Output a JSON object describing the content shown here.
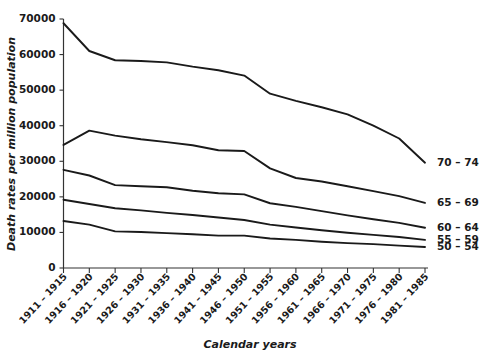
{
  "chart_data": {
    "type": "line",
    "title": "",
    "xlabel": "Calendar years",
    "ylabel": "Death rates per million population",
    "xlim": [
      0,
      14
    ],
    "ylim": [
      0,
      70000
    ],
    "yticks": [
      0,
      10000,
      20000,
      30000,
      40000,
      50000,
      60000,
      70000
    ],
    "ytick_labels": [
      "0",
      "10000",
      "20000",
      "30000",
      "40000",
      "50000",
      "60000",
      "70000"
    ],
    "grid": false,
    "legend_position": "right-inline-end-of-line",
    "categories": [
      "1911 – 1915",
      "1916 – 1920",
      "1921 – 1925",
      "1926 – 1930",
      "1931 – 1935",
      "1936 – 1940",
      "1941 – 1945",
      "1946 – 1950",
      "1951 – 1955",
      "1956 – 1960",
      "1961 – 1965",
      "1966 – 1970",
      "1971 – 1975",
      "1976 – 1980",
      "1981 – 1985"
    ],
    "series": [
      {
        "name": "70 – 74",
        "values": [
          68800,
          61000,
          58400,
          58200,
          57800,
          56600,
          55600,
          54100,
          49000,
          47000,
          45200,
          43200,
          40000,
          36400,
          29600
        ]
      },
      {
        "name": "65 – 69",
        "values": [
          34600,
          38600,
          37200,
          36200,
          35400,
          34500,
          33100,
          32900,
          28000,
          25300,
          24300,
          23000,
          21600,
          20200,
          18300
        ]
      },
      {
        "name": "60 – 64",
        "values": [
          27600,
          26000,
          23300,
          23000,
          22700,
          21700,
          21000,
          20700,
          18200,
          17200,
          16000,
          14800,
          13700,
          12700,
          11300
        ]
      },
      {
        "name": "55 – 59",
        "values": [
          19200,
          18000,
          16800,
          16200,
          15500,
          14900,
          14200,
          13500,
          12200,
          11400,
          10600,
          9900,
          9300,
          8700,
          7900
        ]
      },
      {
        "name": "50 – 54",
        "values": [
          13200,
          12200,
          10300,
          10100,
          9800,
          9500,
          9100,
          9100,
          8300,
          7900,
          7400,
          7000,
          6700,
          6300,
          5900
        ]
      }
    ]
  }
}
